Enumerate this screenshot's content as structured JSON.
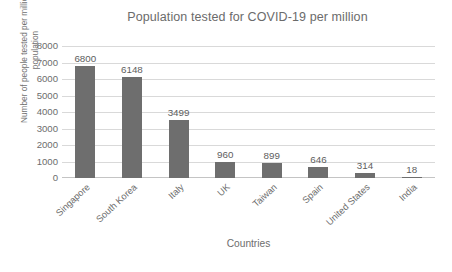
{
  "chart_data": {
    "type": "bar",
    "title": "Population tested for COVID-19 per million",
    "xlabel": "Countries",
    "ylabel": "Number of people tested per million of population",
    "ylabel_line1": "Number of people tested per million of",
    "ylabel_line2": "population",
    "categories": [
      "Singapore",
      "South Korea",
      "Italy",
      "UK",
      "Taiwan",
      "Spain",
      "United States",
      "India"
    ],
    "values": [
      6800,
      6148,
      3499,
      960,
      899,
      646,
      314,
      18
    ],
    "value_labels": [
      "6800",
      "6148",
      "3499",
      "960",
      "899",
      "646",
      "314",
      "18"
    ],
    "ylim": [
      0,
      8000
    ],
    "ytick_labels": [
      "8000",
      "7000",
      "6000",
      "5000",
      "4000",
      "3000",
      "2000",
      "1000",
      "0"
    ],
    "ytick_values": [
      8000,
      7000,
      6000,
      5000,
      4000,
      3000,
      2000,
      1000,
      0
    ],
    "grid": true,
    "grid_axis": "y",
    "legend": false,
    "legend_position": "none",
    "bar_color": "#6e6e6e",
    "grid_color": "#d9d9d9",
    "text_color": "#6d6d6d",
    "background_color": "#ffffff"
  }
}
